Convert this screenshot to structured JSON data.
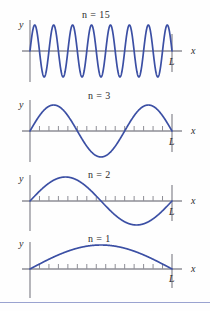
{
  "figure": {
    "curve_color": "#3b4fa4",
    "axis_color": "#8e8e96",
    "text_color": "#2b2b2b",
    "rule_color": "#9aa3d0",
    "background": "#ffffff"
  },
  "axis_labels": {
    "y": "y",
    "x": "x",
    "L": "L"
  },
  "panels": [
    {
      "id": "panel-n15",
      "mode_label": "n = 15",
      "n": 15,
      "half_wavelengths": 15,
      "amplitude_px": 26,
      "ticks": 0,
      "label_left_px": 82,
      "label_top_px": 9
    },
    {
      "id": "panel-n3",
      "mode_label": "n = 3",
      "n": 3,
      "half_wavelengths": 3,
      "amplitude_px": 26,
      "ticks": 14,
      "label_left_px": 88,
      "label_top_px": 92
    },
    {
      "id": "panel-n2",
      "mode_label": "n = 2",
      "n": 2,
      "half_wavelengths": 2,
      "amplitude_px": 24,
      "ticks": 14,
      "label_left_px": 88,
      "label_top_px": 172
    },
    {
      "id": "panel-n1",
      "mode_label": "n = 1",
      "n": 1,
      "half_wavelengths": 1,
      "amplitude_px": 24,
      "ticks": 14,
      "label_left_px": 88,
      "label_top_px": 233
    }
  ],
  "chart_data": {
    "type": "line",
    "xlabel": "x",
    "ylabel": "y",
    "x_range": [
      0,
      1
    ],
    "x_tick_label": "L",
    "grid": false,
    "legend": "none",
    "series": [
      {
        "name": "n = 15",
        "formula": "y = A sin(15 pi x / L)",
        "nodes": 16,
        "antinodes": 15
      },
      {
        "name": "n = 3",
        "formula": "y = A sin(3 pi x / L)",
        "nodes": 4,
        "antinodes": 3
      },
      {
        "name": "n = 2",
        "formula": "y = A sin(2 pi x / L)",
        "nodes": 3,
        "antinodes": 2
      },
      {
        "name": "n = 1",
        "formula": "y = A sin(pi x / L)",
        "nodes": 2,
        "antinodes": 1
      }
    ]
  },
  "layout": {
    "panel_tops": [
      6,
      86,
      166,
      228
    ],
    "panel_heights": [
      80,
      80,
      62,
      70
    ],
    "origin_x": 30,
    "end_x": 172,
    "bottom_rule_top": 302
  }
}
